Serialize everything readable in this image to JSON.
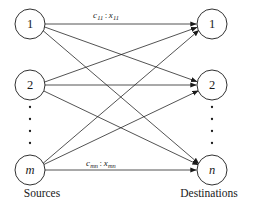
{
  "figure": {
    "background_color": "#ffffff",
    "stroke_color": "#1a1a1a"
  },
  "sources": {
    "group_label": "Sources",
    "nodes": [
      {
        "id": "s1",
        "label": "1",
        "italic": false,
        "cx": 30,
        "cy": 24,
        "r": 15
      },
      {
        "id": "s2",
        "label": "2",
        "italic": false,
        "cx": 30,
        "cy": 85,
        "r": 15
      },
      {
        "id": "sm",
        "label": "m",
        "italic": true,
        "cx": 30,
        "cy": 170,
        "r": 15
      }
    ],
    "ellipsis_dots": 4,
    "group_label_x": 42,
    "group_label_y": 193
  },
  "destinations": {
    "group_label": "Destinations",
    "nodes": [
      {
        "id": "d1",
        "label": "1",
        "italic": false,
        "cx": 212,
        "cy": 24,
        "r": 15
      },
      {
        "id": "d2",
        "label": "2",
        "italic": false,
        "cx": 212,
        "cy": 85,
        "r": 15
      },
      {
        "id": "dn",
        "label": "n",
        "italic": true,
        "cx": 212,
        "cy": 170,
        "r": 15
      }
    ],
    "ellipsis_dots": 4,
    "group_label_x": 209,
    "group_label_y": 193
  },
  "edges": [
    {
      "from": "s1",
      "to": "d1",
      "directed": true
    },
    {
      "from": "s1",
      "to": "d2",
      "directed": true
    },
    {
      "from": "s1",
      "to": "dn",
      "directed": true
    },
    {
      "from": "s2",
      "to": "d1",
      "directed": true
    },
    {
      "from": "s2",
      "to": "d2",
      "directed": true
    },
    {
      "from": "s2",
      "to": "dn",
      "directed": true
    },
    {
      "from": "sm",
      "to": "d1",
      "directed": true
    },
    {
      "from": "sm",
      "to": "d2",
      "directed": true
    },
    {
      "from": "sm",
      "to": "dn",
      "directed": true
    }
  ],
  "edge_labels": {
    "top": {
      "cost_symbol": "c",
      "cost_subscript": "11",
      "separator": ":",
      "flow_symbol": "x",
      "flow_subscript": "11",
      "full_text": "c11 : x11",
      "edge": "s1-d1"
    },
    "bottom": {
      "cost_symbol": "c",
      "cost_subscript": "mn",
      "separator": ":",
      "flow_symbol": "x",
      "flow_subscript": "mn",
      "full_text": "cmn : xmn",
      "edge": "sm-dn"
    }
  }
}
